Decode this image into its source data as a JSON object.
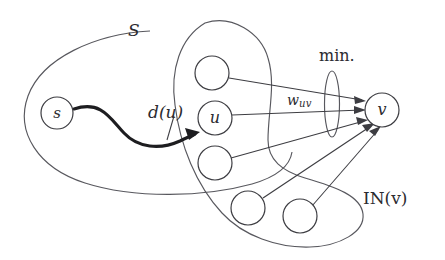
{
  "figure": {
    "background_color": "#ffffff",
    "ink_color": "#3d3d42"
  },
  "labels": {
    "set_S": "S",
    "min": "min.",
    "distance_u": "d(u)",
    "weight_uv_base": "w",
    "weight_uv_sub": "uv",
    "in_v": "IN(v)"
  },
  "nodes": [
    {
      "id": "s",
      "label": "s",
      "cx": 57,
      "cy": 113,
      "r": 16
    },
    {
      "id": "n1",
      "label": "",
      "cx": 212,
      "cy": 73,
      "r": 17
    },
    {
      "id": "u",
      "label": "u",
      "cx": 215,
      "cy": 118,
      "r": 17
    },
    {
      "id": "n3",
      "label": "",
      "cx": 215,
      "cy": 163,
      "r": 17
    },
    {
      "id": "n4",
      "label": "",
      "cx": 248,
      "cy": 208,
      "r": 17
    },
    {
      "id": "n5",
      "label": "",
      "cx": 300,
      "cy": 216,
      "r": 17
    },
    {
      "id": "v",
      "label": "v",
      "cx": 382,
      "cy": 110,
      "r": 17
    }
  ],
  "regions": [
    {
      "id": "set-S",
      "name": "S",
      "shape": "large-ellipse"
    },
    {
      "id": "in-v",
      "name": "IN(v)",
      "shape": "blob"
    },
    {
      "id": "min-ellipse",
      "name": "min.",
      "shape": "narrow-vertical-ellipse"
    }
  ],
  "edges": [
    {
      "from": "n1",
      "to": "v",
      "arrow": true
    },
    {
      "from": "u",
      "to": "v",
      "arrow": true,
      "label": "w_uv"
    },
    {
      "from": "n3",
      "to": "v",
      "arrow": true
    },
    {
      "from": "n4",
      "to": "v",
      "arrow": true
    },
    {
      "from": "n5",
      "to": "v",
      "arrow": true
    }
  ],
  "paths": [
    {
      "from": "s",
      "to": "u",
      "style": "bold-curved",
      "label": "d(u)",
      "arrow": true
    }
  ]
}
